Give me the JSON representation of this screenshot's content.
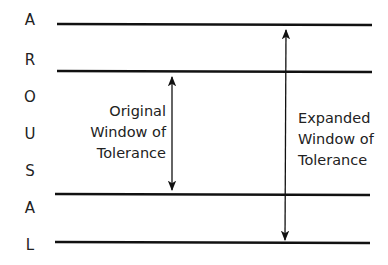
{
  "diagram": {
    "axis_letters": [
      "A",
      "R",
      "O",
      "U",
      "S",
      "A",
      "L"
    ],
    "axis_word": "AROUSAL",
    "horizontal_lines": [
      {
        "name": "expanded-upper-bound",
        "y": 24
      },
      {
        "name": "original-upper-bound",
        "y": 71
      },
      {
        "name": "original-lower-bound",
        "y": 195
      },
      {
        "name": "expanded-lower-bound",
        "y": 243
      }
    ],
    "windows": [
      {
        "name": "original",
        "lines": [
          "Original",
          "Window of",
          "Tolerance"
        ],
        "arrow": {
          "x": 172,
          "y1": 71,
          "y2": 195
        }
      },
      {
        "name": "expanded",
        "lines": [
          "Expanded",
          "Window of",
          "Tolerance"
        ],
        "arrow": {
          "x": 286,
          "y1": 24,
          "y2": 243
        }
      }
    ],
    "colors": {
      "line": "#111111",
      "text": "#222222",
      "background": "#ffffff"
    }
  }
}
